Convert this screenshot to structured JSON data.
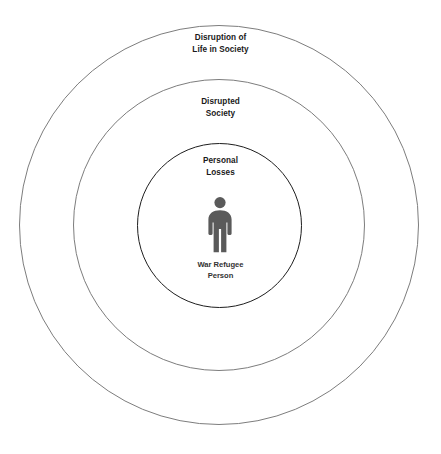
{
  "diagram": {
    "type": "concentric-circles",
    "background_color": "#ffffff",
    "rings": [
      {
        "id": "outer",
        "label": "Disruption of\nLife in Society",
        "stroke_color": "#7d7d7d",
        "level": 3
      },
      {
        "id": "middle",
        "label": "Disrupted\nSociety",
        "stroke_color": "#7d7d7d",
        "level": 2
      },
      {
        "id": "inner",
        "label": "Personal\nLosses",
        "stroke_color": "#1e1e1e",
        "level": 1
      }
    ],
    "center": {
      "icon": "person-icon",
      "icon_color": "#5a5a5a",
      "caption": "War Refugee\nPerson"
    }
  }
}
